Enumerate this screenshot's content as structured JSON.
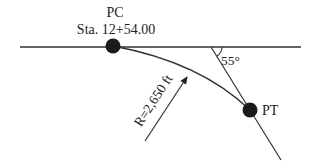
{
  "diagram": {
    "type": "horizontal-curve",
    "colors": {
      "line": "#333333",
      "point": "#1a1a1a",
      "text": "#222222",
      "background": "#ffffff"
    },
    "points": {
      "pc": {
        "label": "PC",
        "station": "Sta. 12+54.00"
      },
      "pt": {
        "label": "PT"
      }
    },
    "angle": {
      "label": "55°"
    },
    "radius": {
      "label": "R=2,650 ft"
    }
  }
}
